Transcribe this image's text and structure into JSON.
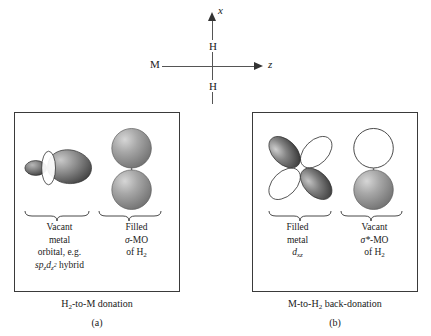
{
  "figure": {
    "axis_diagram": {
      "metal_label": "M",
      "hydrogen_top": "H",
      "hydrogen_bottom": "H",
      "axis_vertical_label": "x",
      "axis_horizontal_label": "z"
    },
    "panels": [
      {
        "id": "a",
        "caption": "H₂-to-M donation",
        "sub_letter": "(a)",
        "left_group": {
          "orbital_name": "sp_z d_z2 hybrid orbital",
          "lines": [
            "Vacant",
            "metal",
            "orbital, e.g.",
            "sp<sub>z</sub>d<sub>z2</sub> hybrid"
          ],
          "line1": "Vacant",
          "line2": "metal",
          "line3": "orbital, e.g.",
          "line4_prefix": "sp",
          "line4_sub1": "z",
          "line4_mid": "d",
          "line4_sub2": "z",
          "line4_sup2": "2",
          "line4_suffix": "hybrid",
          "occupancy": "vacant"
        },
        "right_group": {
          "orbital_name": "sigma-MO of H2",
          "line1": "Filled",
          "line2_symbol": "σ",
          "line2_rest": "-MO",
          "line3_prefix": "of H",
          "line3_sub": "2",
          "occupancy": "filled"
        }
      },
      {
        "id": "b",
        "caption": "M-to-H₂ back-donation",
        "sub_letter": "(b)",
        "left_group": {
          "orbital_name": "d_xz metal orbital",
          "line1": "Filled",
          "line2": "metal",
          "line3_prefix": "d",
          "line3_sub": "xz",
          "occupancy": "filled"
        },
        "right_group": {
          "orbital_name": "sigma-star-MO of H2",
          "line1": "Vacant",
          "line2_symbol": "σ*",
          "line2_rest": "-MO",
          "line3_prefix": "of H",
          "line3_sub": "2",
          "occupancy": "vacant"
        }
      }
    ],
    "colors": {
      "lobe_shaded": "#4a4a4a",
      "lobe_empty": "#ffffff",
      "outline": "#333333",
      "sphere_gray": "#9a9a9a",
      "box_border": "#3a3a3a"
    }
  }
}
